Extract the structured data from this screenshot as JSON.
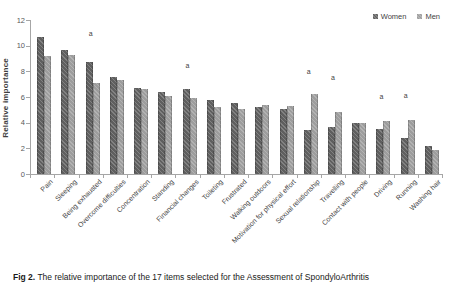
{
  "chart_data": {
    "type": "bar",
    "title": "",
    "xlabel": "",
    "ylabel": "Relative importance",
    "ylim": [
      0,
      12
    ],
    "yticks": [
      0,
      2,
      4,
      6,
      8,
      10,
      12
    ],
    "grid": false,
    "legend_position": "top-right",
    "categories": [
      "Pain",
      "Sleeping",
      "Being exhausted",
      "Overcome difficulties",
      "Concentration",
      "Standing",
      "Financial changes",
      "Toileting",
      "Frustrated",
      "Walking outdoors",
      "Motivation for physical effort",
      "Sexual relationship",
      "Travelling",
      "Contact with people",
      "Driving",
      "Running",
      "Washing hair"
    ],
    "series": [
      {
        "name": "Women",
        "color": "#5f5f5f",
        "values": [
          10.7,
          9.7,
          8.7,
          7.6,
          6.7,
          6.4,
          6.6,
          5.8,
          5.5,
          5.2,
          5.1,
          3.4,
          3.7,
          4.0,
          3.5,
          2.8,
          2.2
        ]
      },
      {
        "name": "Men",
        "color": "#9d9d9d",
        "values": [
          9.2,
          9.3,
          7.1,
          7.3,
          6.6,
          6.1,
          5.9,
          5.2,
          5.1,
          5.4,
          5.3,
          6.2,
          4.8,
          4.0,
          4.1,
          4.2,
          1.9
        ]
      }
    ],
    "annotations": [
      {
        "category": "Being exhausted",
        "label": "a",
        "value_y": 11.2
      },
      {
        "category": "Financial changes",
        "label": "a",
        "value_y": 8.7
      },
      {
        "category": "Sexual relationship",
        "label": "a",
        "value_y": 8.3
      },
      {
        "category": "Travelling",
        "label": "a",
        "value_y": 7.8
      },
      {
        "category": "Driving",
        "label": "a",
        "value_y": 6.3
      },
      {
        "category": "Running",
        "label": "a",
        "value_y": 6.4
      }
    ]
  },
  "caption": {
    "fig_label": "Fig 2.",
    "text": " The relative importance of the 17 items selected for the Assessment of SpondyloArthritis"
  }
}
